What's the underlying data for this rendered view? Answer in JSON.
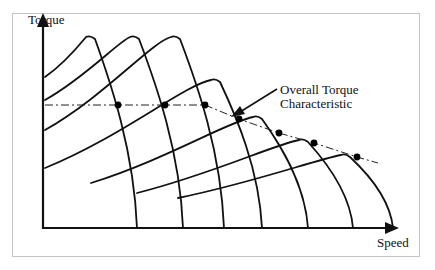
{
  "diagram": {
    "type": "torque-speed characteristic",
    "axes": {
      "y_label": "Torque",
      "x_label": "Speed"
    },
    "annotation": {
      "line1": "Overall Torque",
      "line2": "Characteristic"
    },
    "colors": {
      "ink": "#111111",
      "frame": "#c4c4c4",
      "background": "#ffffff"
    },
    "curves": [
      {
        "id": "c1",
        "start": [
          45,
          77
        ],
        "peak": [
          90,
          36
        ],
        "end": [
          137,
          228
        ]
      },
      {
        "id": "c2",
        "start": [
          45,
          100
        ],
        "peak": [
          134,
          36
        ],
        "end": [
          183,
          228
        ]
      },
      {
        "id": "c3",
        "start": [
          45,
          130
        ],
        "peak": [
          175,
          36
        ],
        "end": [
          224,
          228
        ]
      },
      {
        "id": "c4",
        "start": [
          45,
          168
        ],
        "peak": [
          215,
          79
        ],
        "end": [
          262,
          228
        ]
      },
      {
        "id": "c5",
        "start": [
          91,
          183
        ],
        "peak": [
          257,
          116
        ],
        "end": [
          308,
          228
        ]
      },
      {
        "id": "c6",
        "start": [
          137,
          193
        ],
        "peak": [
          303,
          139
        ],
        "end": [
          353,
          228
        ]
      },
      {
        "id": "c7",
        "start": [
          178,
          198
        ],
        "peak": [
          345,
          154
        ],
        "end": [
          393,
          228
        ]
      }
    ],
    "operating_points": [
      [
        118,
        105
      ],
      [
        165,
        105
      ],
      [
        205,
        105
      ],
      [
        239,
        119
      ],
      [
        279,
        133
      ],
      [
        314,
        143
      ],
      [
        357,
        157
      ]
    ]
  }
}
